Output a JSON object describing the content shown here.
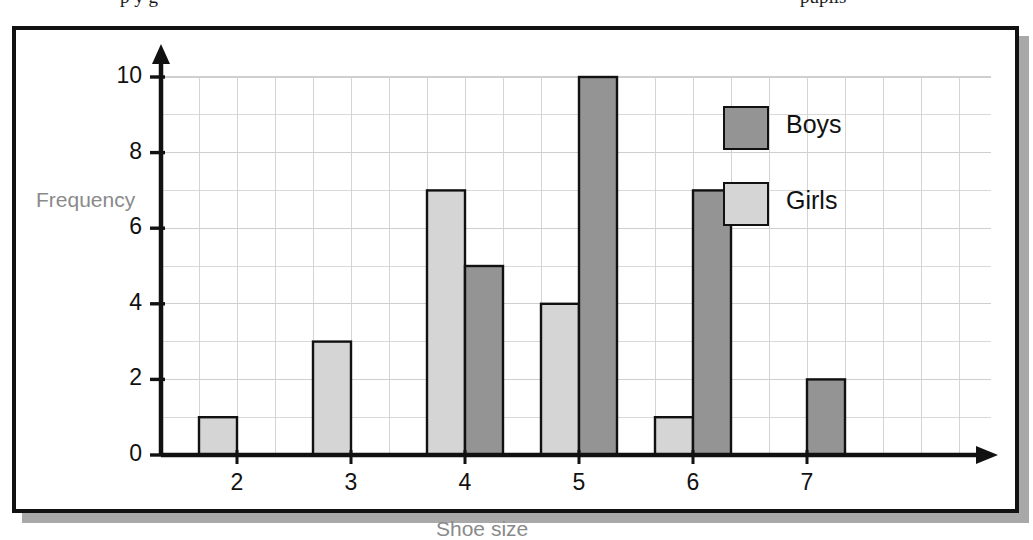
{
  "scan": {
    "top_text_left_fragment": "p    y    g",
    "top_text_right_fragment": "pupils"
  },
  "chart_data": {
    "type": "bar",
    "title": "",
    "subtitle": "",
    "xlabel": "Shoe size",
    "ylabel": "Frequency",
    "categories": [
      "2",
      "3",
      "4",
      "5",
      "6",
      "7"
    ],
    "series": [
      {
        "name": "Boys",
        "color": "#949494",
        "values": [
          0,
          0,
          5,
          10,
          7,
          2
        ]
      },
      {
        "name": "Girls",
        "color": "#d5d5d5",
        "values": [
          1,
          3,
          7,
          4,
          1,
          0
        ]
      }
    ],
    "series_order_in_plot": [
      "Girls",
      "Boys"
    ],
    "ylim": [
      0,
      10
    ],
    "yticks": [
      "0",
      "2",
      "4",
      "6",
      "8",
      "10"
    ],
    "ytick_values": [
      0,
      2,
      4,
      6,
      8,
      10
    ],
    "xticks": [
      "2",
      "3",
      "4",
      "5",
      "6",
      "7"
    ],
    "grid": true,
    "grid_minor_step": 1,
    "grid_color": "#cfcfcf",
    "legend_position": "top-right",
    "legend": [
      {
        "label": "Boys",
        "color": "#949494"
      },
      {
        "label": "Girls",
        "color": "#d5d5d5"
      }
    ],
    "axis_color": "#111111",
    "bar_border_color": "#111111",
    "label_color": "#8a8a8a"
  }
}
